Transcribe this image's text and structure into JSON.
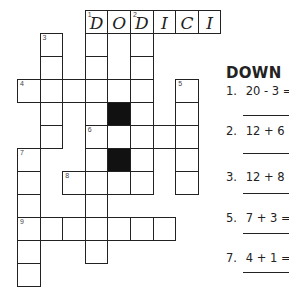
{
  "puzzle": {
    "type": "crossword",
    "across_answer_1": [
      "D",
      "O",
      "D",
      "I",
      "C",
      "I"
    ],
    "cells": [
      {
        "r": 0,
        "c": 3,
        "num": "1",
        "letter": "D"
      },
      {
        "r": 0,
        "c": 4,
        "letter": "O"
      },
      {
        "r": 0,
        "c": 5,
        "num": "2",
        "letter": "D"
      },
      {
        "r": 0,
        "c": 6,
        "letter": "I"
      },
      {
        "r": 0,
        "c": 7,
        "letter": "C"
      },
      {
        "r": 0,
        "c": 8,
        "letter": "I"
      },
      {
        "r": 1,
        "c": 1,
        "num": "3"
      },
      {
        "r": 1,
        "c": 3
      },
      {
        "r": 1,
        "c": 5
      },
      {
        "r": 2,
        "c": 1
      },
      {
        "r": 2,
        "c": 3
      },
      {
        "r": 2,
        "c": 5
      },
      {
        "r": 3,
        "c": 0,
        "num": "4"
      },
      {
        "r": 3,
        "c": 1
      },
      {
        "r": 3,
        "c": 2
      },
      {
        "r": 3,
        "c": 3
      },
      {
        "r": 3,
        "c": 4
      },
      {
        "r": 3,
        "c": 5
      },
      {
        "r": 3,
        "c": 7,
        "num": "5"
      },
      {
        "r": 4,
        "c": 1
      },
      {
        "r": 4,
        "c": 3
      },
      {
        "r": 4,
        "c": 4,
        "black": true
      },
      {
        "r": 4,
        "c": 5
      },
      {
        "r": 4,
        "c": 7
      },
      {
        "r": 5,
        "c": 1
      },
      {
        "r": 5,
        "c": 3,
        "num": "6"
      },
      {
        "r": 5,
        "c": 4
      },
      {
        "r": 5,
        "c": 5
      },
      {
        "r": 5,
        "c": 6
      },
      {
        "r": 5,
        "c": 7
      },
      {
        "r": 6,
        "c": 0,
        "num": "7"
      },
      {
        "r": 6,
        "c": 3
      },
      {
        "r": 6,
        "c": 4,
        "black": true
      },
      {
        "r": 6,
        "c": 5
      },
      {
        "r": 6,
        "c": 7
      },
      {
        "r": 7,
        "c": 0
      },
      {
        "r": 7,
        "c": 2,
        "num": "8"
      },
      {
        "r": 7,
        "c": 3
      },
      {
        "r": 7,
        "c": 4
      },
      {
        "r": 7,
        "c": 5
      },
      {
        "r": 7,
        "c": 7
      },
      {
        "r": 8,
        "c": 0
      },
      {
        "r": 8,
        "c": 3
      },
      {
        "r": 9,
        "c": 0,
        "num": "9"
      },
      {
        "r": 9,
        "c": 1
      },
      {
        "r": 9,
        "c": 2
      },
      {
        "r": 9,
        "c": 3
      },
      {
        "r": 9,
        "c": 4
      },
      {
        "r": 9,
        "c": 5
      },
      {
        "r": 9,
        "c": 6
      },
      {
        "r": 10,
        "c": 0
      },
      {
        "r": 10,
        "c": 3
      },
      {
        "r": 11,
        "c": 0
      }
    ]
  },
  "clues": {
    "heading": "DOWN",
    "items": [
      {
        "num": "1.",
        "text": "20 - 3 ="
      },
      {
        "num": "2.",
        "text": "12 + 6 ="
      },
      {
        "num": "3.",
        "text": "12 + 8 ="
      },
      {
        "num": "5.",
        "text": "7 + 3 ="
      },
      {
        "num": "7.",
        "text": "4 + 1 ="
      }
    ]
  }
}
